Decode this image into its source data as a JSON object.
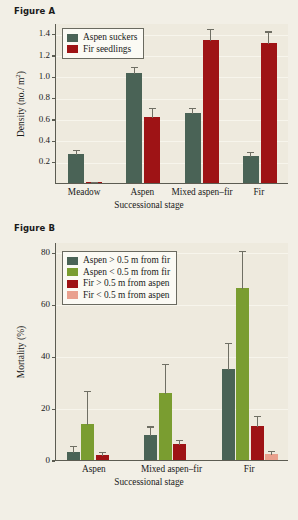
{
  "page": {
    "background_color": "#f2efe6",
    "plot_background_color": "#eeeade"
  },
  "figure_a": {
    "title": "Figure A",
    "legend": [
      {
        "label": "Aspen suckers",
        "color": "#4a6356",
        "key": "aspen-suckers"
      },
      {
        "label": "Fir seedlings",
        "color": "#9e1315",
        "key": "fir-seedlings"
      }
    ],
    "ylabel_main": "Density (no./ m",
    "ylabel_exp": "2",
    "ylabel_close": ")",
    "xlabel": "Successional stage",
    "yticks": [
      "0.2",
      "0.4",
      "0.6",
      "0.8",
      "1.0",
      "1.2",
      "1.4"
    ],
    "categories": [
      "Meadow",
      "Aspen",
      "Mixed aspen–fir",
      "Fir"
    ]
  },
  "figure_b": {
    "title": "Figure B",
    "legend": [
      {
        "label": "Aspen > 0.5 m from fir",
        "color": "#4a6356",
        "key": "aspen-gt"
      },
      {
        "label": "Aspen < 0.5 m from fir",
        "color": "#7a9d30",
        "key": "aspen-lt"
      },
      {
        "label": "Fir > 0.5 m from aspen",
        "color": "#9e1315",
        "key": "fir-gt"
      },
      {
        "label": "Fir < 0.5 m from aspen",
        "color": "#e9a08d",
        "key": "fir-lt"
      }
    ],
    "ylabel": "Mortality (%)",
    "xlabel": "Successional stage",
    "yticks": [
      "0",
      "20",
      "40",
      "60",
      "80"
    ],
    "categories": [
      "Aspen",
      "Mixed aspen–fir",
      "Fir"
    ]
  },
  "chart_data": [
    {
      "id": "figure-a",
      "type": "bar",
      "title": "Figure A",
      "xlabel": "Successional stage",
      "ylabel": "Density (no./ m2)",
      "ylim": [
        0,
        1.5
      ],
      "yticks": [
        0.2,
        0.4,
        0.6,
        0.8,
        1.0,
        1.2,
        1.4
      ],
      "grid": true,
      "legend_position": "top-left",
      "categories": [
        "Meadow",
        "Aspen",
        "Mixed aspen–fir",
        "Fir"
      ],
      "series": [
        {
          "name": "Aspen suckers",
          "color": "#4a6356",
          "values": [
            0.27,
            1.03,
            0.66,
            0.25
          ],
          "errors": [
            0.05,
            0.07,
            0.05,
            0.05
          ]
        },
        {
          "name": "Fir seedlings",
          "color": "#9e1315",
          "values": [
            0.01,
            0.62,
            1.34,
            1.31
          ],
          "errors": [
            0.01,
            0.09,
            0.11,
            0.12
          ]
        }
      ]
    },
    {
      "id": "figure-b",
      "type": "bar",
      "title": "Figure B",
      "xlabel": "Successional stage",
      "ylabel": "Mortality (%)",
      "ylim": [
        0,
        84
      ],
      "yticks": [
        0,
        20,
        40,
        60,
        80
      ],
      "grid": true,
      "legend_position": "top-left",
      "categories": [
        "Aspen",
        "Mixed aspen–fir",
        "Fir"
      ],
      "series": [
        {
          "name": "Aspen > 0.5 m from fir",
          "color": "#4a6356",
          "values": [
            3.2,
            9.8,
            35.0
          ],
          "errors": [
            2.5,
            3.5,
            10.5
          ]
        },
        {
          "name": "Aspen < 0.5 m from fir",
          "color": "#7a9d30",
          "values": [
            13.7,
            25.8,
            66.3
          ],
          "errors": [
            13.2,
            11.5,
            14.5
          ]
        },
        {
          "name": "Fir > 0.5 m from aspen",
          "color": "#9e1315",
          "values": [
            2.0,
            6.0,
            13.0
          ],
          "errors": [
            1.6,
            2.0,
            4.5
          ]
        },
        {
          "name": "Fir < 0.5 m from aspen",
          "color": "#e9a08d",
          "values": [
            0,
            0,
            2.4
          ],
          "errors": [
            0,
            0,
            1.6
          ]
        }
      ]
    }
  ]
}
